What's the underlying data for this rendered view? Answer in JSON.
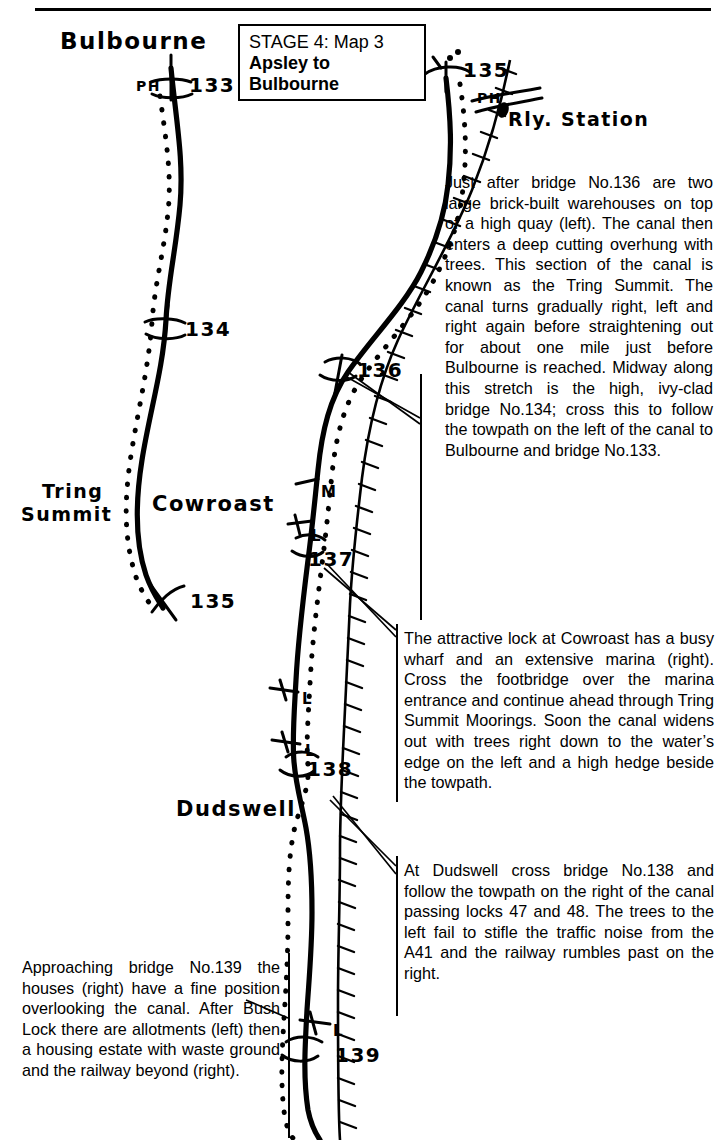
{
  "page": {
    "kind": "canal-towpath-guide-map-page",
    "top_rule": true
  },
  "stage_box": {
    "line1": "STAGE 4: Map 3",
    "line2_a": "Apsley to",
    "line2_b": "Bulbourne"
  },
  "map_labels": [
    {
      "name": "bulbourne-label",
      "text": "Bulbourne",
      "x": 60,
      "y": 28,
      "size": 23
    },
    {
      "name": "ph-label-133",
      "text": "PH",
      "x": 136,
      "y": 78,
      "size": 14
    },
    {
      "name": "bridge-133-label",
      "text": "133",
      "x": 189,
      "y": 73,
      "size": 20
    },
    {
      "name": "bridge-134-label",
      "text": "134",
      "x": 185,
      "y": 317,
      "size": 20
    },
    {
      "name": "tring-summit-label-1",
      "text": "Tring",
      "x": 42,
      "y": 480,
      "size": 19
    },
    {
      "name": "tring-summit-label-2",
      "text": "Summit",
      "x": 21,
      "y": 503,
      "size": 19
    },
    {
      "name": "cowroast-label",
      "text": "Cowroast",
      "x": 152,
      "y": 492,
      "size": 21
    },
    {
      "name": "bridge-135-left-label",
      "text": "135",
      "x": 190,
      "y": 589,
      "size": 20
    },
    {
      "name": "bridge-135-top-label",
      "text": "135",
      "x": 463,
      "y": 58,
      "size": 20
    },
    {
      "name": "ph-label-135",
      "text": "PH",
      "x": 477,
      "y": 90,
      "size": 14
    },
    {
      "name": "rly-station-label",
      "text": "Rly. Station",
      "x": 508,
      "y": 108,
      "size": 19
    },
    {
      "name": "bridge-136-label",
      "text": "136",
      "x": 357,
      "y": 358,
      "size": 20
    },
    {
      "name": "marina-label-m",
      "text": "M",
      "x": 321,
      "y": 483,
      "size": 15
    },
    {
      "name": "lock-label-l-137",
      "text": "L",
      "x": 311,
      "y": 527,
      "size": 15
    },
    {
      "name": "bridge-137-label",
      "text": "137",
      "x": 308,
      "y": 547,
      "size": 20
    },
    {
      "name": "lock-label-l-upper",
      "text": "L",
      "x": 302,
      "y": 690,
      "size": 15
    },
    {
      "name": "lock-label-l-lower",
      "text": "L",
      "x": 305,
      "y": 742,
      "size": 15
    },
    {
      "name": "bridge-138-label",
      "text": "138",
      "x": 307,
      "y": 757,
      "size": 20
    },
    {
      "name": "dudswell-label",
      "text": "Dudswell",
      "x": 176,
      "y": 797,
      "size": 21
    },
    {
      "name": "lock-label-l-139",
      "text": "L",
      "x": 333,
      "y": 1022,
      "size": 15
    },
    {
      "name": "bridge-139-label",
      "text": "139",
      "x": 335,
      "y": 1043,
      "size": 20
    }
  ],
  "descriptions": {
    "tring_summit": "Just after bridge No.136 are two large brick-built warehouses on top of a high quay (left). The canal then enters a deep cutting overhung with trees. This section of the canal is known as the Tring Summit. The canal turns gradually right, left and right again before straightening out for about one mile just before Bulbourne is reached. Midway along this stretch is the high, ivy-clad bridge No.134; cross this to follow the towpath on the left of the canal to Bulbourne and bridge No.133.",
    "cowroast": "The attractive lock at Cowroast has a busy wharf and an extensive marina (right). Cross the footbridge over the marina entrance and continue ahead through Tring Summit Moorings. Soon the canal widens out with trees right down to the water’s edge on the left and a high hedge beside the towpath.",
    "dudswell": "At Dudswell cross bridge No.138 and follow the towpath on the right of the canal passing locks 47 and 48. The trees to the left fail to stifle the traffic noise from the A41 and the railway rumbles past on the right.",
    "bridge_139": "Approaching bridge No.139 the houses (right) have a fine position overlooking the canal. After Bush Lock there are allotments (left) then a housing estate with waste ground and the railway beyond (right)."
  },
  "colors": {
    "ink": "#000000",
    "paper": "#ffffff"
  }
}
